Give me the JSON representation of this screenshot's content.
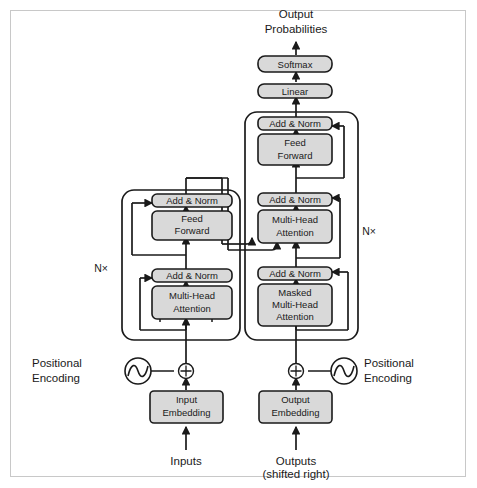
{
  "figure": {
    "frame_color": "#c8c8c8",
    "background": "#ffffff",
    "box_fill": "#d9d9d9",
    "line_color": "#1a1a1a"
  },
  "top_labels": {
    "output_probabilities_line1": "Output",
    "output_probabilities_line2": "Probabilities"
  },
  "head_blocks": {
    "softmax": "Softmax",
    "linear": "Linear"
  },
  "encoder": {
    "repeat_label": "N×",
    "blocks": [
      {
        "id": "enc-add-norm-2",
        "label": "Add & Norm"
      },
      {
        "id": "enc-feed-forward",
        "line1": "Feed",
        "line2": "Forward"
      },
      {
        "id": "enc-add-norm-1",
        "label": "Add & Norm"
      },
      {
        "id": "enc-multi-head-attention",
        "line1": "Multi-Head",
        "line2": "Attention"
      }
    ],
    "embedding": {
      "line1": "Input",
      "line2": "Embedding"
    },
    "positional_encoding_line1": "Positional",
    "positional_encoding_line2": "Encoding",
    "input_label": "Inputs"
  },
  "decoder": {
    "repeat_label": "N×",
    "blocks": [
      {
        "id": "dec-add-norm-3",
        "label": "Add & Norm"
      },
      {
        "id": "dec-feed-forward",
        "line1": "Feed",
        "line2": "Forward"
      },
      {
        "id": "dec-add-norm-2",
        "label": "Add & Norm"
      },
      {
        "id": "dec-multi-head-attention",
        "line1": "Multi-Head",
        "line2": "Attention"
      },
      {
        "id": "dec-add-norm-1",
        "label": "Add & Norm"
      },
      {
        "id": "dec-masked-multi-head-attention",
        "line1": "Masked",
        "line2": "Multi-Head",
        "line3": "Attention"
      }
    ],
    "embedding": {
      "line1": "Output",
      "line2": "Embedding"
    },
    "positional_encoding_line1": "Positional",
    "positional_encoding_line2": "Encoding",
    "output_label_line1": "Outputs",
    "output_label_line2": "(shifted right)"
  }
}
